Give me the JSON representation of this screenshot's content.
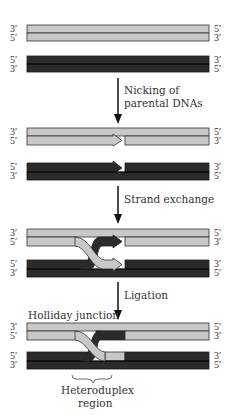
{
  "colors": {
    "parent_light": "#c8c8c8",
    "parent_dark": "#2b2b2b",
    "outline": "#333333",
    "text": "#333333"
  },
  "end_labels": {
    "three_prime": "3′",
    "five_prime": "5′"
  },
  "panels": [
    {
      "name": "parental-dnas",
      "light_left": [
        "3′",
        "5′"
      ],
      "light_right": [
        "5′",
        "3′"
      ],
      "dark_left": [
        "5′",
        "3′"
      ],
      "dark_right": [
        "3′",
        "5′"
      ]
    },
    {
      "name": "nicked-dnas",
      "light_left": [
        "3′",
        "5′"
      ],
      "light_right": [
        "5′",
        "3′"
      ],
      "dark_left": [
        "5′",
        "3′"
      ],
      "dark_right": [
        "3′",
        "5′"
      ]
    },
    {
      "name": "strand-exchange",
      "light_left": [
        "3′",
        "5′"
      ],
      "light_right": [
        "5′",
        "3′"
      ],
      "dark_left": [
        "5′",
        "3′"
      ],
      "dark_right": [
        "3′",
        "5′"
      ]
    },
    {
      "name": "holliday-junction",
      "light_left": [
        "3′",
        "5′"
      ],
      "light_right": [
        "5′",
        "3′"
      ],
      "dark_left": [
        "5′",
        "3′"
      ],
      "dark_right": [
        "3′",
        "5′"
      ]
    }
  ],
  "steps": {
    "step1_line1": "Nicking of",
    "step1_line2": "parental DNAs",
    "step2": "Strand exchange",
    "step3": "Ligation"
  },
  "annotations": {
    "holliday": "Holliday junction",
    "heteroduplex_line1": "Heteroduplex",
    "heteroduplex_line2": "region"
  }
}
